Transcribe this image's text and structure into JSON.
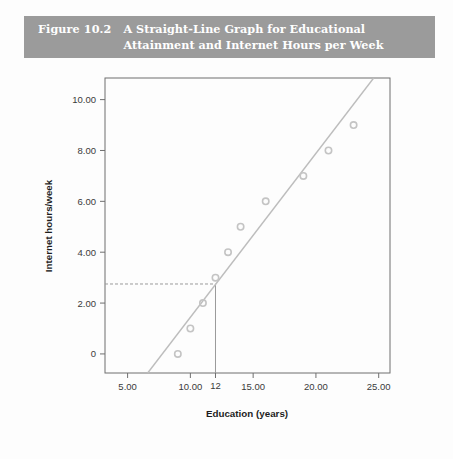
{
  "figure": {
    "number_label": "Figure 10.2",
    "title": "A Straight-Line Graph for Educational Attainment and Internet Hours per Week",
    "caption_bar_color": "#9b9b9b",
    "caption_text_color": "#ffffff"
  },
  "chart_data": {
    "type": "scatter",
    "title": "",
    "xlabel": "Education (years)",
    "ylabel": "Internet hours/week",
    "xlim": [
      3.2,
      25.9
    ],
    "ylim": [
      -0.75,
      10.85
    ],
    "grid": false,
    "legend": null,
    "x_ticks": [
      "5.00",
      "10.00",
      "15.00",
      "20.00",
      "25.00"
    ],
    "x_tick_values": [
      5,
      10,
      15,
      20,
      25
    ],
    "y_ticks": [
      "0",
      "2.00",
      "4.00",
      "6.00",
      "8.00",
      "10.00"
    ],
    "y_tick_values": [
      0,
      2,
      4,
      6,
      8,
      10
    ],
    "annotation_x_tick": "12",
    "annotation_x_value": 12,
    "annotation_y_value": 2.75,
    "marker_color": "#c4c4c4",
    "line_color": "#bdbdbd",
    "axis_color": "#6f6f6f",
    "guide_color": "#9a9a9a",
    "points": [
      {
        "x": 9,
        "y": 0
      },
      {
        "x": 10,
        "y": 1
      },
      {
        "x": 11,
        "y": 2
      },
      {
        "x": 12,
        "y": 3
      },
      {
        "x": 13,
        "y": 4
      },
      {
        "x": 14,
        "y": 5
      },
      {
        "x": 16,
        "y": 6
      },
      {
        "x": 19,
        "y": 7
      },
      {
        "x": 21,
        "y": 8
      },
      {
        "x": 23,
        "y": 9
      }
    ],
    "fit_line": {
      "name": "regression line",
      "x1": 6.6,
      "y1": -0.75,
      "x2": 24.6,
      "y2": 10.85
    },
    "guides": [
      {
        "name": "horizontal-dashed-guide",
        "from_x": 3.2,
        "to_x": 12,
        "y": 2.75,
        "style": "dashed"
      },
      {
        "name": "vertical-solid-guide",
        "x": 12,
        "from_y": -0.75,
        "to_y": 2.75,
        "style": "solid"
      }
    ]
  }
}
